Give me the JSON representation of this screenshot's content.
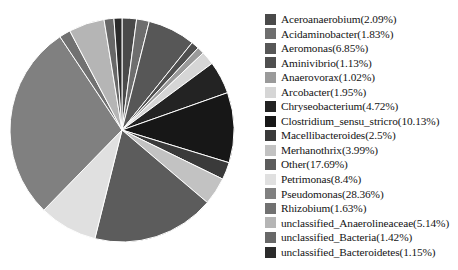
{
  "chart_data": {
    "type": "pie",
    "title": "",
    "start_angle_deg": 0,
    "direction": "clockwise",
    "legend_position": "right",
    "grid": false,
    "unit": "%",
    "labels": [
      "Aceroanaerobium(2.09%)",
      "Acidaminobacter(1.83%)",
      "Aeromonas(6.85%)",
      "Aminivibrio(1.13%)",
      "Anaerovorax(1.02%)",
      "Arcobacter(1.95%)",
      "Chryseobacterium(4.72%)",
      "Clostridium_sensu_stricro(10.13%)",
      "Macellibacteroides(2.5%)",
      "Merhanothrix(3.99%)",
      "Other(17.69%)",
      "Petrimonas(8.4%)",
      "Pseudomonas(28.36%)",
      "Rhizobium(1.63%)",
      "unclassified_Anaerolineaceae(5.14%)",
      "unclassified_Bacteria(1.42%)",
      "unclassified_Bacteroidetes(1.15%)"
    ],
    "categories": [
      "Aceroanaerobium",
      "Acidaminobacter",
      "Aeromonas",
      "Aminivibrio",
      "Anaerovorax",
      "Arcobacter",
      "Chryseobacterium",
      "Clostridium_sensu_stricro",
      "Macellibacteroides",
      "Merhanothrix",
      "Other",
      "Petrimonas",
      "Pseudomonas",
      "Rhizobium",
      "unclassified_Anaerolineaceae",
      "unclassified_Bacteria",
      "unclassified_Bacteroidetes"
    ],
    "values": [
      2.09,
      1.83,
      6.85,
      1.13,
      1.02,
      1.95,
      4.72,
      10.13,
      2.5,
      3.99,
      17.69,
      8.4,
      28.36,
      1.63,
      5.14,
      1.42,
      1.15
    ],
    "colors": [
      "#4a4a4a",
      "#6e6e6e",
      "#575757",
      "#4f4f4f",
      "#9a9a9a",
      "#d6d6d6",
      "#232323",
      "#171717",
      "#3a3a3a",
      "#c2c2c2",
      "#5c5c5c",
      "#e0e0e0",
      "#808080",
      "#717171",
      "#b5b5b5",
      "#686868",
      "#2b2b2b"
    ],
    "slice_order": [
      "Aceroanaerobium",
      "Acidaminobacter",
      "Aeromonas",
      "Aminivibrio",
      "Anaerovorax",
      "Arcobacter",
      "Chryseobacterium",
      "Clostridium_sensu_stricro",
      "Macellibacteroides",
      "Merhanothrix",
      "Other",
      "Petrimonas",
      "Pseudomonas",
      "Rhizobium",
      "unclassified_Anaerolineaceae",
      "unclassified_Bacteria",
      "unclassified_Bacteroidetes"
    ]
  }
}
